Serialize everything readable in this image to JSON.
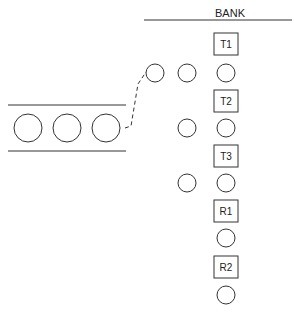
{
  "diagram": {
    "header_label": "BANK",
    "tellers": [
      {
        "label": "T1"
      },
      {
        "label": "T2"
      },
      {
        "label": "T3"
      },
      {
        "label": "R1"
      },
      {
        "label": "R2"
      }
    ],
    "queue_customers_outside": 3,
    "waiting_customers": [
      {
        "teller": "T1",
        "waiting": 2
      },
      {
        "teller": "T2",
        "waiting": 1
      },
      {
        "teller": "T3",
        "waiting": 1
      },
      {
        "teller": "R1",
        "waiting": 0
      },
      {
        "teller": "R2",
        "waiting": 0
      }
    ],
    "stroke_color": "#333333",
    "background_color": "#ffffff"
  }
}
